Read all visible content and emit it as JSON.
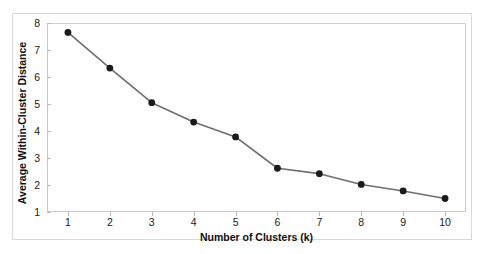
{
  "chart_data": {
    "type": "line",
    "title": "",
    "subtitle": "",
    "xlabel": "Number of Clusters (k)",
    "ylabel": "Average Within-Cluster Distance",
    "x": [
      1,
      2,
      3,
      4,
      5,
      6,
      7,
      8,
      9,
      10
    ],
    "values": [
      7.65,
      6.33,
      5.05,
      4.33,
      3.78,
      2.62,
      2.42,
      2.02,
      1.78,
      1.5
    ],
    "series": [
      {
        "name": "Average Within-Cluster Distance",
        "values": [
          7.65,
          6.33,
          5.05,
          4.33,
          3.78,
          2.62,
          2.42,
          2.02,
          1.78,
          1.5
        ]
      }
    ],
    "xlim": [
      0.5,
      10.5
    ],
    "ylim": [
      1,
      8
    ],
    "xticks": [
      1,
      2,
      3,
      4,
      5,
      6,
      7,
      8,
      9,
      10
    ],
    "yticks": [
      1,
      2,
      3,
      4,
      5,
      6,
      7,
      8
    ],
    "xtick_labels": [
      "1",
      "2",
      "3",
      "4",
      "5",
      "6",
      "7",
      "8",
      "9",
      "10"
    ],
    "ytick_labels": [
      "1",
      "2",
      "3",
      "4",
      "5",
      "6",
      "7",
      "8"
    ],
    "grid": false,
    "legend": false,
    "legend_position": "none",
    "annotations": [],
    "marker": "circle",
    "colors": {
      "line": "#6e6e6e",
      "marker": "#1a1a1a",
      "axis": "#c9c9c9",
      "frame": "#d9d9d9",
      "background": "#ffffff",
      "text": "#111111"
    }
  }
}
